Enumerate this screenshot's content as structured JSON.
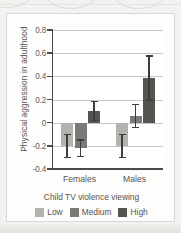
{
  "chart_data": {
    "type": "bar",
    "title": "",
    "xlabel": "Child TV violence viewing",
    "ylabel": "Physical aggression in adulthood",
    "categories": [
      "Females",
      "Males"
    ],
    "ylim": [
      -0.4,
      0.8
    ],
    "ytick_labels": [
      "0.8",
      "0.6",
      "0.4",
      "0.2",
      "0",
      "-0.2",
      "-0.4"
    ],
    "ytick_values": [
      0.8,
      0.6,
      0.4,
      0.2,
      0,
      -0.2,
      -0.4
    ],
    "grid": true,
    "legend_position": "bottom",
    "series": [
      {
        "name": "Low",
        "color": "#b4b2af",
        "values": [
          -0.2,
          -0.2
        ],
        "errors": [
          0.1,
          0.1
        ]
      },
      {
        "name": "Medium",
        "color": "#7c7a77",
        "values": [
          -0.22,
          0.055
        ],
        "errors": [
          0.07,
          0.1
        ]
      },
      {
        "name": "High",
        "color": "#565451",
        "values": [
          0.1,
          0.385
        ],
        "errors": [
          0.08,
          0.19
        ]
      }
    ]
  },
  "legend": {
    "items": [
      {
        "label": "Low",
        "color": "#b4b2af"
      },
      {
        "label": "Medium",
        "color": "#7c7a77"
      },
      {
        "label": "High",
        "color": "#565451"
      }
    ]
  },
  "axes": {
    "y_title": "Physical aggression in adulthood",
    "x_title": "Child TV violence viewing",
    "y_ticks": [
      {
        "label": "0.8",
        "value": 0.8
      },
      {
        "label": "0.6",
        "value": 0.6
      },
      {
        "label": "0.4",
        "value": 0.4
      },
      {
        "label": "0.2",
        "value": 0.2
      },
      {
        "label": "0",
        "value": 0
      },
      {
        "label": "-0.2",
        "value": -0.2
      },
      {
        "label": "-0.4",
        "value": -0.4
      }
    ],
    "groups": [
      {
        "label": "Females"
      },
      {
        "label": "Males"
      }
    ]
  }
}
